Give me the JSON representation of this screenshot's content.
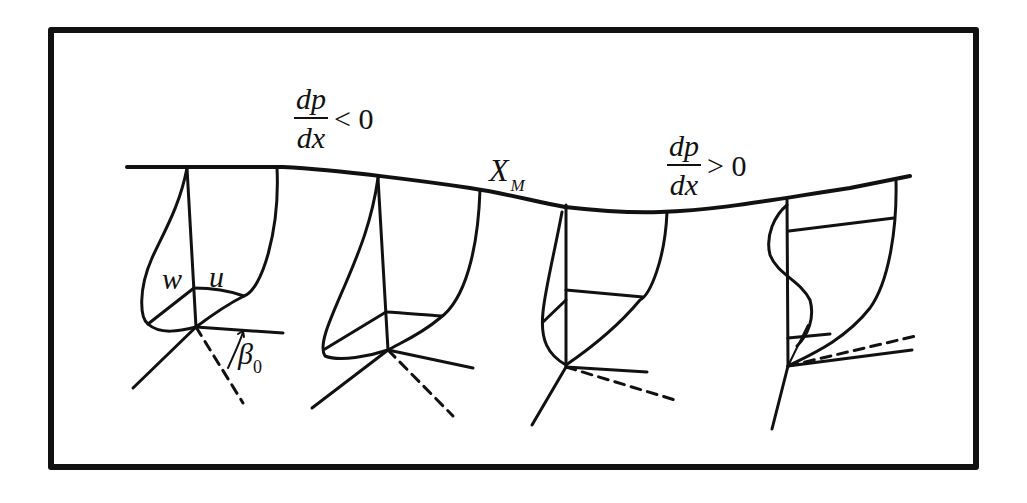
{
  "figure": {
    "type": "boundary-layer velocity profiles along a wall with pressure gradient",
    "frame": {
      "border_color": "#111111",
      "background": "#ffffff"
    },
    "labels": {
      "favorable_gradient": {
        "numerator": "dp",
        "denominator": "dx",
        "relation": "< 0"
      },
      "adverse_gradient": {
        "numerator": "dp",
        "denominator": "dx",
        "relation": "> 0"
      },
      "minimum_point": {
        "main": "X",
        "subscript": "M"
      },
      "crossflow_component": "w",
      "streamwise_component": "u",
      "wall_angle": {
        "main": "β",
        "subscript": "0"
      }
    },
    "stations": [
      {
        "id": 1,
        "region": "favorable gradient",
        "note": "labeled u and w profiles with angle β0"
      },
      {
        "id": 2,
        "region": "favorable gradient",
        "note": "skewed 3D profile"
      },
      {
        "id": 3,
        "region": "pressure minimum X_M",
        "note": "profile at minimum pressure point"
      },
      {
        "id": 4,
        "region": "adverse gradient",
        "note": "S-shaped crossflow profile with reversal"
      }
    ]
  }
}
